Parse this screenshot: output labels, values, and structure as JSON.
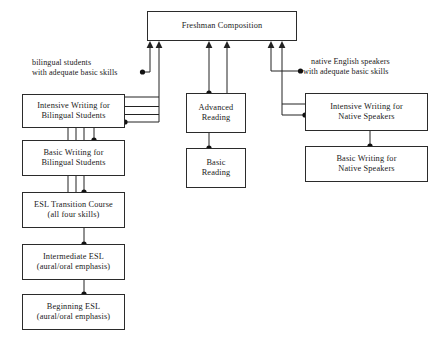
{
  "diagram": {
    "nodes": {
      "freshman_composition": {
        "line1": "Freshman Composition"
      },
      "intensive_writing_bilingual": {
        "line1": "Intensive Writing for",
        "line2": "Bilingual Students"
      },
      "basic_writing_bilingual": {
        "line1": "Basic Writing for",
        "line2": "Bilingual Students"
      },
      "esl_transition": {
        "line1": "ESL Transition Course",
        "line2": "(all four skills)"
      },
      "intermediate_esl": {
        "line1": "Intermediate ESL",
        "line2": "(aural/oral emphasis)"
      },
      "beginning_esl": {
        "line1": "Beginning ESL",
        "line2": "(aural/oral emphasis)"
      },
      "advanced_reading": {
        "line1": "Advanced",
        "line2": "Reading"
      },
      "basic_reading": {
        "line1": "Basic",
        "line2": "Reading"
      },
      "intensive_writing_native": {
        "line1": "Intensive Writing for",
        "line2": "Native Speakers"
      },
      "basic_writing_native": {
        "line1": "Basic Writing for",
        "line2": "Native Speakers"
      }
    },
    "annotations": {
      "bilingual_entry": {
        "line1": "bilingual students",
        "line2": "with adequate basic skills"
      },
      "native_entry": {
        "line1": "native English speakers",
        "line2": "with adequate basic skills"
      }
    },
    "colors": {
      "line": "#222222",
      "box_border": "#2b2b2b",
      "background": "#ffffff",
      "text": "#1a1a1a"
    }
  }
}
